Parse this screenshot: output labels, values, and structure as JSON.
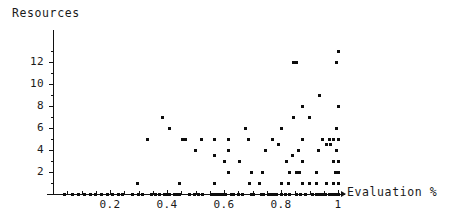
{
  "chart_data": {
    "type": "scatter",
    "title": "",
    "xlabel": "Evaluation %",
    "ylabel": "Resources",
    "xlim": [
      0,
      1.04
    ],
    "ylim": [
      0,
      13.8
    ],
    "grid": false,
    "legend": null,
    "xticks": [
      0.2,
      0.4,
      0.6,
      0.8,
      1
    ],
    "xtick_labels": [
      "0.2",
      "0.4",
      "0.6",
      "0.8",
      "1"
    ],
    "xticks_minor": [
      0.05,
      0.1,
      0.15,
      0.25,
      0.3,
      0.35,
      0.45,
      0.5,
      0.55,
      0.65,
      0.7,
      0.75,
      0.85,
      0.9,
      0.95
    ],
    "yticks": [
      2,
      4,
      6,
      8,
      10,
      12
    ],
    "ytick_labels": [
      "2",
      "4",
      "6",
      "8",
      "10",
      "12"
    ],
    "yticks_minor": [
      1,
      3,
      5,
      7,
      9,
      11,
      13
    ],
    "marker": "square",
    "marker_color": "#0d0d0d",
    "marker_size": 3,
    "points": [
      [
        0.04,
        0
      ],
      [
        0.07,
        0
      ],
      [
        0.09,
        0
      ],
      [
        0.11,
        0
      ],
      [
        0.13,
        0
      ],
      [
        0.15,
        0
      ],
      [
        0.17,
        0
      ],
      [
        0.19,
        0
      ],
      [
        0.21,
        0
      ],
      [
        0.23,
        0
      ],
      [
        0.245,
        0
      ],
      [
        0.28,
        0
      ],
      [
        0.3,
        0
      ],
      [
        0.315,
        0
      ],
      [
        0.345,
        0
      ],
      [
        0.36,
        0
      ],
      [
        0.375,
        0
      ],
      [
        0.39,
        0
      ],
      [
        0.4,
        0
      ],
      [
        0.41,
        0
      ],
      [
        0.425,
        0
      ],
      [
        0.435,
        0
      ],
      [
        0.445,
        0
      ],
      [
        0.48,
        0
      ],
      [
        0.495,
        0
      ],
      [
        0.51,
        0
      ],
      [
        0.525,
        0
      ],
      [
        0.555,
        0
      ],
      [
        0.565,
        0
      ],
      [
        0.575,
        0
      ],
      [
        0.585,
        0
      ],
      [
        0.595,
        0
      ],
      [
        0.605,
        0
      ],
      [
        0.625,
        0
      ],
      [
        0.635,
        0
      ],
      [
        0.65,
        0
      ],
      [
        0.665,
        0
      ],
      [
        0.695,
        0
      ],
      [
        0.705,
        0
      ],
      [
        0.73,
        0
      ],
      [
        0.74,
        0
      ],
      [
        0.755,
        0
      ],
      [
        0.765,
        0
      ],
      [
        0.775,
        0
      ],
      [
        0.785,
        0
      ],
      [
        0.8,
        0
      ],
      [
        0.815,
        0
      ],
      [
        0.83,
        0
      ],
      [
        0.855,
        0
      ],
      [
        0.87,
        0
      ],
      [
        0.885,
        0
      ],
      [
        0.91,
        0
      ],
      [
        0.925,
        0
      ],
      [
        0.935,
        0
      ],
      [
        0.945,
        0
      ],
      [
        0.955,
        0
      ],
      [
        0.97,
        0
      ],
      [
        0.98,
        0
      ],
      [
        0.99,
        0
      ],
      [
        1.0,
        0
      ],
      [
        0.295,
        1
      ],
      [
        0.445,
        1
      ],
      [
        0.565,
        1
      ],
      [
        0.69,
        1
      ],
      [
        0.725,
        1
      ],
      [
        0.8,
        1
      ],
      [
        0.825,
        1
      ],
      [
        0.875,
        1
      ],
      [
        0.9,
        1
      ],
      [
        0.925,
        1
      ],
      [
        0.96,
        1
      ],
      [
        0.985,
        1
      ],
      [
        1.0,
        1
      ],
      [
        0.615,
        2
      ],
      [
        0.695,
        2
      ],
      [
        0.735,
        2
      ],
      [
        0.83,
        2
      ],
      [
        0.855,
        2
      ],
      [
        0.865,
        2
      ],
      [
        0.925,
        2
      ],
      [
        0.99,
        2
      ],
      [
        1.0,
        2
      ],
      [
        0.6,
        3
      ],
      [
        0.655,
        3
      ],
      [
        0.82,
        3
      ],
      [
        0.875,
        3
      ],
      [
        0.985,
        3
      ],
      [
        1.0,
        3
      ],
      [
        0.565,
        3.5
      ],
      [
        0.84,
        3.5
      ],
      [
        0.5,
        4
      ],
      [
        0.615,
        4
      ],
      [
        0.745,
        4
      ],
      [
        0.86,
        4
      ],
      [
        0.93,
        4
      ],
      [
        0.995,
        4
      ],
      [
        0.79,
        4.5
      ],
      [
        0.96,
        4.5
      ],
      [
        0.975,
        4.5
      ],
      [
        0.33,
        5
      ],
      [
        0.455,
        5
      ],
      [
        0.465,
        5
      ],
      [
        0.52,
        5
      ],
      [
        0.565,
        5
      ],
      [
        0.615,
        5
      ],
      [
        0.685,
        5
      ],
      [
        0.77,
        5
      ],
      [
        0.875,
        5
      ],
      [
        0.945,
        5
      ],
      [
        0.97,
        5
      ],
      [
        0.985,
        5
      ],
      [
        1.0,
        5
      ],
      [
        0.675,
        6
      ],
      [
        0.8,
        6
      ],
      [
        0.995,
        6
      ],
      [
        0.41,
        6
      ],
      [
        0.385,
        7
      ],
      [
        0.845,
        7
      ],
      [
        0.9,
        7
      ],
      [
        0.875,
        8
      ],
      [
        1.0,
        8
      ],
      [
        0.935,
        9
      ],
      [
        0.845,
        12
      ],
      [
        0.855,
        12
      ],
      [
        0.995,
        12
      ],
      [
        1.0,
        13
      ]
    ]
  }
}
